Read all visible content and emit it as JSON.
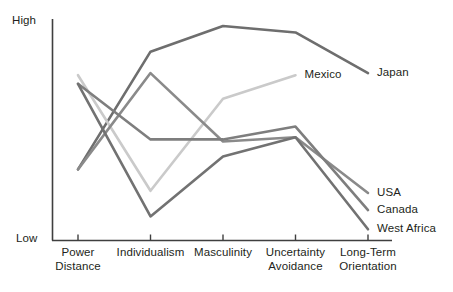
{
  "chart_data": {
    "type": "line",
    "title": "",
    "xlabel": "",
    "ylabel": "",
    "grid": false,
    "legend_position": "inline-right",
    "categories": [
      "Power Distance",
      "Individualism",
      "Masculinity",
      "Uncertainty Avoidance",
      "Long-Term Orientation"
    ],
    "category_lines": [
      [
        "Power",
        "Distance"
      ],
      [
        "Individualism"
      ],
      [
        "Masculinity"
      ],
      [
        "Uncertainty",
        "Avoidance"
      ],
      [
        "Long-Term",
        "Orientation"
      ]
    ],
    "y_axis": {
      "min_label": "Low",
      "max_label": "High",
      "ylim": [
        0,
        100
      ],
      "ticks": []
    },
    "series": [
      {
        "name": "Japan",
        "color": "#6e6e6e",
        "label": "Japan",
        "values": [
          33,
          88,
          100,
          97,
          78
        ]
      },
      {
        "name": "Mexico",
        "color": "#cacaca",
        "label": "Mexico",
        "values": [
          77,
          23,
          66,
          77,
          null
        ]
      },
      {
        "name": "USA",
        "color": "#8a8a8a",
        "label": "USA",
        "values": [
          33,
          78,
          46,
          48,
          22
        ]
      },
      {
        "name": "Canada",
        "color": "#7e7e7e",
        "label": "Canada",
        "values": [
          73,
          47,
          47,
          53,
          14
        ]
      },
      {
        "name": "West Africa",
        "color": "#727272",
        "label": "West Africa",
        "values": [
          73,
          11,
          39,
          48,
          5
        ]
      }
    ]
  },
  "labels": {
    "high": "High",
    "low": "Low"
  }
}
